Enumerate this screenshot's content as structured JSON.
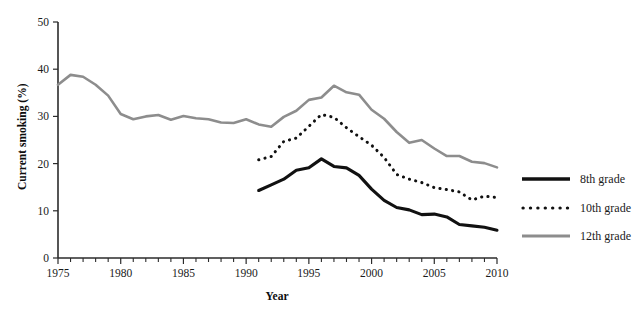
{
  "chart_data": {
    "type": "line",
    "title": "",
    "xlabel": "Year",
    "ylabel": "Current smoking (%)",
    "xlim": [
      1975,
      2010
    ],
    "ylim": [
      0,
      50
    ],
    "yticks": [
      0,
      10,
      20,
      30,
      40,
      50
    ],
    "xticks_labeled": [
      1975,
      1980,
      1985,
      1990,
      1995,
      2000,
      2005,
      2010
    ],
    "xtick_step_minor": 1,
    "grid": false,
    "legend_position": "right",
    "series": [
      {
        "name": "8th grade",
        "style": "solid-thick-black",
        "color": "#111111",
        "x": [
          1991,
          1992,
          1993,
          1994,
          1995,
          1996,
          1997,
          1998,
          1999,
          2000,
          2001,
          2002,
          2003,
          2004,
          2005,
          2006,
          2007,
          2008,
          2009,
          2010
        ],
        "values": [
          14.3,
          15.5,
          16.7,
          18.6,
          19.1,
          21.0,
          19.4,
          19.1,
          17.5,
          14.6,
          12.2,
          10.7,
          10.2,
          9.2,
          9.3,
          8.7,
          7.1,
          6.8,
          6.5,
          5.9
        ]
      },
      {
        "name": "10th grade",
        "style": "dotted-black",
        "color": "#111111",
        "x": [
          1991,
          1992,
          1993,
          1994,
          1995,
          1996,
          1997,
          1998,
          1999,
          2000,
          2001,
          2002,
          2003,
          2004,
          2005,
          2006,
          2007,
          2008,
          2009,
          2010
        ],
        "values": [
          20.8,
          21.5,
          24.7,
          25.4,
          27.9,
          30.4,
          29.8,
          27.6,
          25.7,
          23.9,
          21.3,
          17.7,
          16.7,
          16.0,
          14.9,
          14.5,
          14.0,
          12.3,
          13.1,
          12.8
        ]
      },
      {
        "name": "12th grade",
        "style": "solid-gray",
        "color": "#8d8d8d",
        "x": [
          1975,
          1976,
          1977,
          1978,
          1979,
          1980,
          1981,
          1982,
          1983,
          1984,
          1985,
          1986,
          1987,
          1988,
          1989,
          1990,
          1991,
          1992,
          1993,
          1994,
          1995,
          1996,
          1997,
          1998,
          1999,
          2000,
          2001,
          2002,
          2003,
          2004,
          2005,
          2006,
          2007,
          2008,
          2009,
          2010
        ],
        "values": [
          36.7,
          38.8,
          38.4,
          36.7,
          34.4,
          30.5,
          29.4,
          30.0,
          30.3,
          29.3,
          30.1,
          29.6,
          29.4,
          28.7,
          28.6,
          29.4,
          28.3,
          27.8,
          29.9,
          31.2,
          33.5,
          34.0,
          36.5,
          35.1,
          34.6,
          31.4,
          29.5,
          26.7,
          24.4,
          25.0,
          23.2,
          21.6,
          21.6,
          20.4,
          20.1,
          19.2
        ]
      }
    ]
  },
  "axes": {
    "y_title": "Current smoking (%)",
    "x_title": "Year",
    "y_tick_labels": [
      "0",
      "10",
      "20",
      "30",
      "40",
      "50"
    ],
    "x_tick_labels": [
      "1975",
      "1980",
      "1985",
      "1990",
      "1995",
      "2000",
      "2005",
      "2010"
    ]
  },
  "legend": {
    "items": [
      {
        "label": "8th grade",
        "swatch": "solid-thick-black-line-icon"
      },
      {
        "label": "10th grade",
        "swatch": "dotted-black-line-icon"
      },
      {
        "label": "12th grade",
        "swatch": "solid-gray-line-icon"
      }
    ]
  },
  "colors": {
    "grade8": "#111111",
    "grade10": "#111111",
    "grade12": "#8d8d8d",
    "axis": "#2b2b2b",
    "background": "#ffffff"
  }
}
